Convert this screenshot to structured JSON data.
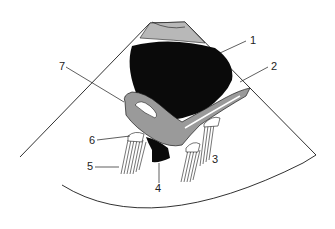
{
  "diagram": {
    "type": "ultrasound-schematic",
    "colors": {
      "fluid": "#0a0a0a",
      "tissue": "#9a9a9a",
      "outline": "#1a1a1a",
      "background": "#ffffff",
      "wall": "#b8b8b8"
    },
    "labels": [
      {
        "id": "1",
        "text": "1",
        "x": 250,
        "y": 44
      },
      {
        "id": "2",
        "text": "2",
        "x": 271,
        "y": 70
      },
      {
        "id": "3",
        "text": "3",
        "x": 212,
        "y": 163
      },
      {
        "id": "4",
        "text": "4",
        "x": 155,
        "y": 192
      },
      {
        "id": "5",
        "text": "5",
        "x": 87,
        "y": 170
      },
      {
        "id": "6",
        "text": "6",
        "x": 89,
        "y": 144
      },
      {
        "id": "7",
        "text": "7",
        "x": 59,
        "y": 70
      }
    ]
  }
}
